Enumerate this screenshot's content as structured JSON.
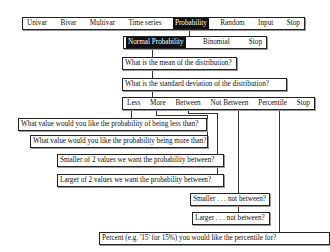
{
  "main_menu": {
    "items": [
      "Univar",
      "Bivar",
      "Multivar",
      "Time series",
      "Probability",
      "Random",
      "Input",
      "Stop"
    ],
    "selected": "Probability"
  },
  "probability_menu": {
    "items": [
      "Normal Probability",
      "Binomial",
      "Stop"
    ],
    "selected": "Normal Probability"
  },
  "prompts": {
    "mean": "What is the mean of the distribution?",
    "sd": "What is the standard deviation of the distribution?"
  },
  "choice_menu": {
    "items": [
      "Less",
      "More",
      "Between",
      "Not Between",
      "Percentile",
      "Stop"
    ]
  },
  "questions": {
    "less": "What value would you like the probability of being less than?",
    "more": "What value would you like the probability being more than?",
    "between_smaller": "Smaller of  2  values we want the probability between?",
    "between_larger": "Larger of  2  values we want the probability between?",
    "not_between_smaller": "Smaller . . . not between?",
    "not_between_larger": "Larger . . . not between?",
    "percentile": "Percent (e.g. '15' for 15%) you would like the percentile for?"
  }
}
